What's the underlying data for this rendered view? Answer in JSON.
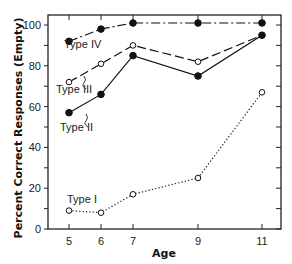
{
  "chart_data": {
    "type": "line",
    "title": "",
    "xlabel": "Age",
    "ylabel": "Percent Correct Responses (Empty)",
    "x": [
      5,
      6,
      7,
      9,
      11
    ],
    "x_tick_labels": [
      "5",
      "6",
      "7",
      "9",
      "11"
    ],
    "y_tick_labels": [
      "0",
      "20",
      "40",
      "60",
      "80",
      "100"
    ],
    "xlim": [
      4.5,
      11.6
    ],
    "ylim": [
      0,
      105
    ],
    "grid": false,
    "legend": "inline labels",
    "series": [
      {
        "name": "Type IV",
        "label": "Type IV",
        "style": "dash-dot",
        "marker": "filled-circle",
        "values": [
          92,
          98,
          101,
          101,
          101
        ]
      },
      {
        "name": "Type III",
        "label": "Type III",
        "style": "dashed",
        "marker": "open-circle",
        "values": [
          72,
          81,
          90,
          82,
          95
        ]
      },
      {
        "name": "Type II",
        "label": "Type II",
        "style": "solid",
        "marker": "filled-circle",
        "values": [
          57,
          66,
          85,
          75,
          95
        ]
      },
      {
        "name": "Type I",
        "label": "Type I",
        "style": "dotted",
        "marker": "open-circle",
        "values": [
          9,
          8,
          17,
          25,
          67
        ]
      }
    ]
  },
  "labels": {
    "xlabel": "Age",
    "ylabel": "Percent Correct Responses (Empty)",
    "type4": "Type IV",
    "type3": "Type III",
    "type2": "Type II",
    "type1": "Type I"
  }
}
